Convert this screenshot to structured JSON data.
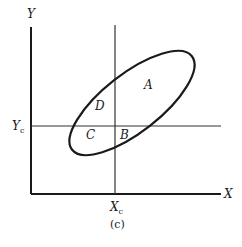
{
  "diagram": {
    "caption": "(c)",
    "axes": {
      "x_label": "X",
      "y_label": "Y"
    },
    "threshold_lines": {
      "x_threshold": {
        "label": "X",
        "subscript": "c"
      },
      "y_threshold": {
        "label": "Y",
        "subscript": "c"
      }
    },
    "regions": [
      {
        "id": "A",
        "label": "A",
        "position": "upper-right inside ellipse"
      },
      {
        "id": "B",
        "label": "B",
        "position": "lower-right inside ellipse, near intersection"
      },
      {
        "id": "C",
        "label": "C",
        "position": "lower-left inside ellipse"
      },
      {
        "id": "D",
        "label": "D",
        "position": "upper-left inside ellipse"
      }
    ],
    "shape": "tilted ellipse (positive correlation)",
    "colors": {
      "line": "#1a1a1a",
      "background": "#ffffff"
    }
  }
}
